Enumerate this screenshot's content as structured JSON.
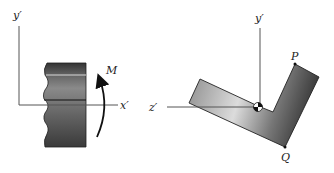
{
  "left_figure": {
    "y_axis_label": "y′",
    "x_axis_label": "x′",
    "moment_label": "M"
  },
  "right_figure": {
    "y_axis_label": "y′",
    "z_axis_label": "z′",
    "point_p_label": "P",
    "point_q_label": "Q"
  },
  "colors": {
    "axis": "#555555",
    "beam_dark": "#3a3a3a",
    "beam_light": "#8a8a8a",
    "section_dark": "#444444",
    "section_light": "#e0e0e0"
  }
}
